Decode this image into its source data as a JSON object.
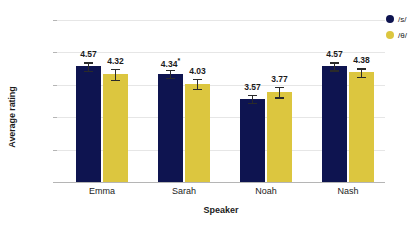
{
  "chart_data": {
    "type": "bar",
    "title": "",
    "xlabel": "Speaker",
    "ylabel": "Average rating",
    "ylim": [
      1.0,
      6.0
    ],
    "ytick_step": 1.0,
    "grid": true,
    "legend_position": "right",
    "categories": [
      "Emma",
      "Sarah",
      "Noah",
      "Nash"
    ],
    "ytick_labels": [
      "6.00",
      "5.00",
      "4.00",
      "3.00",
      "2.00",
      "1.00"
    ],
    "ytick_values": [
      6.0,
      5.0,
      4.0,
      3.0,
      2.0,
      1.0
    ],
    "series": [
      {
        "name": "/s/",
        "color": "#0e1450",
        "values": [
          4.57,
          4.34,
          3.57,
          4.57
        ],
        "labels": [
          "4.57",
          "4.34",
          "3.57",
          "4.57"
        ],
        "annotations": [
          "",
          "*",
          "",
          ""
        ],
        "errors": [
          0.13,
          0.12,
          0.13,
          0.12
        ]
      },
      {
        "name": "/θ/",
        "color": "#dcc63f",
        "values": [
          4.32,
          4.03,
          3.77,
          4.38
        ],
        "labels": [
          "4.32",
          "4.03",
          "3.77",
          "4.38"
        ],
        "annotations": [
          "",
          "",
          "",
          ""
        ],
        "errors": [
          0.17,
          0.15,
          0.16,
          0.13
        ]
      }
    ]
  },
  "legend": {
    "items": [
      {
        "label": "/s/",
        "color": "#0e1450"
      },
      {
        "label": "/θ/",
        "color": "#dcc63f"
      }
    ]
  },
  "axes": {
    "x_title": "Speaker",
    "y_title": "Average rating"
  }
}
